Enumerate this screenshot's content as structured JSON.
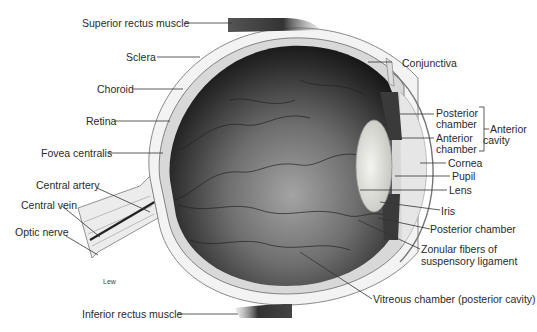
{
  "diagram": {
    "artist_signature": "Lew",
    "labels_left": {
      "superior_rectus": "Superior rectus muscle",
      "sclera": "Sclera",
      "choroid": "Choroid",
      "retina": "Retina",
      "fovea": "Fovea centralis",
      "central_artery": "Central artery",
      "central_vein": "Central vein",
      "optic_nerve": "Optic nerve",
      "inferior_rectus": "Inferior rectus muscle"
    },
    "labels_right": {
      "conjunctiva": "Conjunctiva",
      "posterior_chamber_1": "Posterior",
      "posterior_chamber_2": "chamber",
      "anterior_chamber_1": "Anterior",
      "anterior_chamber_2": "chamber",
      "anterior_cavity_1": "Anterior",
      "anterior_cavity_2": "cavity",
      "cornea": "Cornea",
      "pupil": "Pupil",
      "lens": "Lens",
      "iris": "Iris",
      "posterior_chamber_lower": "Posterior chamber",
      "zonular_1": "Zonular fibers of",
      "zonular_2": "suspensory ligament",
      "vitreous": "Vitreous chamber (posterior cavity)"
    },
    "colors": {
      "background": "#ffffff",
      "sclera": "#f2f2f2",
      "vitreous_dark": "#1e1e1e",
      "vitreous_light": "#9a9a9a",
      "muscle": "#3a3a3a",
      "leader": "#333333",
      "text": "#2a2a2a"
    }
  }
}
